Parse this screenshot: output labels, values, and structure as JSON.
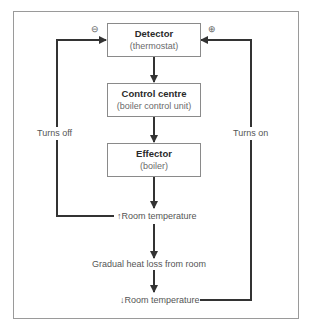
{
  "diagram": {
    "nodes": {
      "detector": {
        "title": "Detector",
        "subtitle": "(thermostat)"
      },
      "control": {
        "title": "Control centre",
        "subtitle": "(boiler control unit)"
      },
      "effector": {
        "title": "Effector",
        "subtitle": "(boiler)"
      },
      "room_up": "↑Room temperature",
      "heat_loss": "Gradual heat loss from room",
      "room_down": "↓Room temperature"
    },
    "loops": {
      "left_label": "Turns off",
      "right_label": "Turns on",
      "left_sign": "⊖",
      "right_sign": "⊕"
    },
    "colors": {
      "line": "#333333",
      "box_border": "#8a8a8a",
      "frame": "#9a9a9a"
    }
  }
}
